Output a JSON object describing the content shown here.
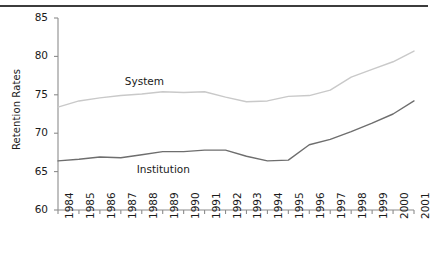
{
  "figure": {
    "ylabel": "Retention Rates",
    "rule": "top-horizontal-rule"
  },
  "chart_data": {
    "type": "line",
    "title": "",
    "xlabel": "",
    "ylabel": "Retention Rates",
    "ylim": [
      60,
      85
    ],
    "yticks": [
      60,
      65,
      70,
      75,
      80,
      85
    ],
    "grid": false,
    "legend": "inline-annotations",
    "categories": [
      "1984",
      "1985",
      "1986",
      "1987",
      "1988",
      "1989",
      "1990",
      "1991",
      "1992",
      "1993",
      "1994",
      "1995",
      "1996",
      "1997",
      "1998",
      "1999",
      "2000",
      "2001"
    ],
    "series": [
      {
        "name": "System",
        "color": "#c9c9c9",
        "label_x_year": "1987",
        "values": [
          73.4,
          74.2,
          74.6,
          74.9,
          75.1,
          75.4,
          75.3,
          75.4,
          74.7,
          74.1,
          74.2,
          74.8,
          74.9,
          75.6,
          77.3,
          78.3,
          79.3,
          80.7
        ]
      },
      {
        "name": "Institution",
        "color": "#6e6e6e",
        "label_x_year": "1988",
        "values": [
          66.4,
          66.6,
          66.9,
          66.8,
          67.2,
          67.6,
          67.6,
          67.8,
          67.8,
          67.0,
          66.4,
          66.5,
          68.5,
          69.2,
          70.2,
          71.3,
          72.5,
          74.2
        ]
      }
    ]
  }
}
